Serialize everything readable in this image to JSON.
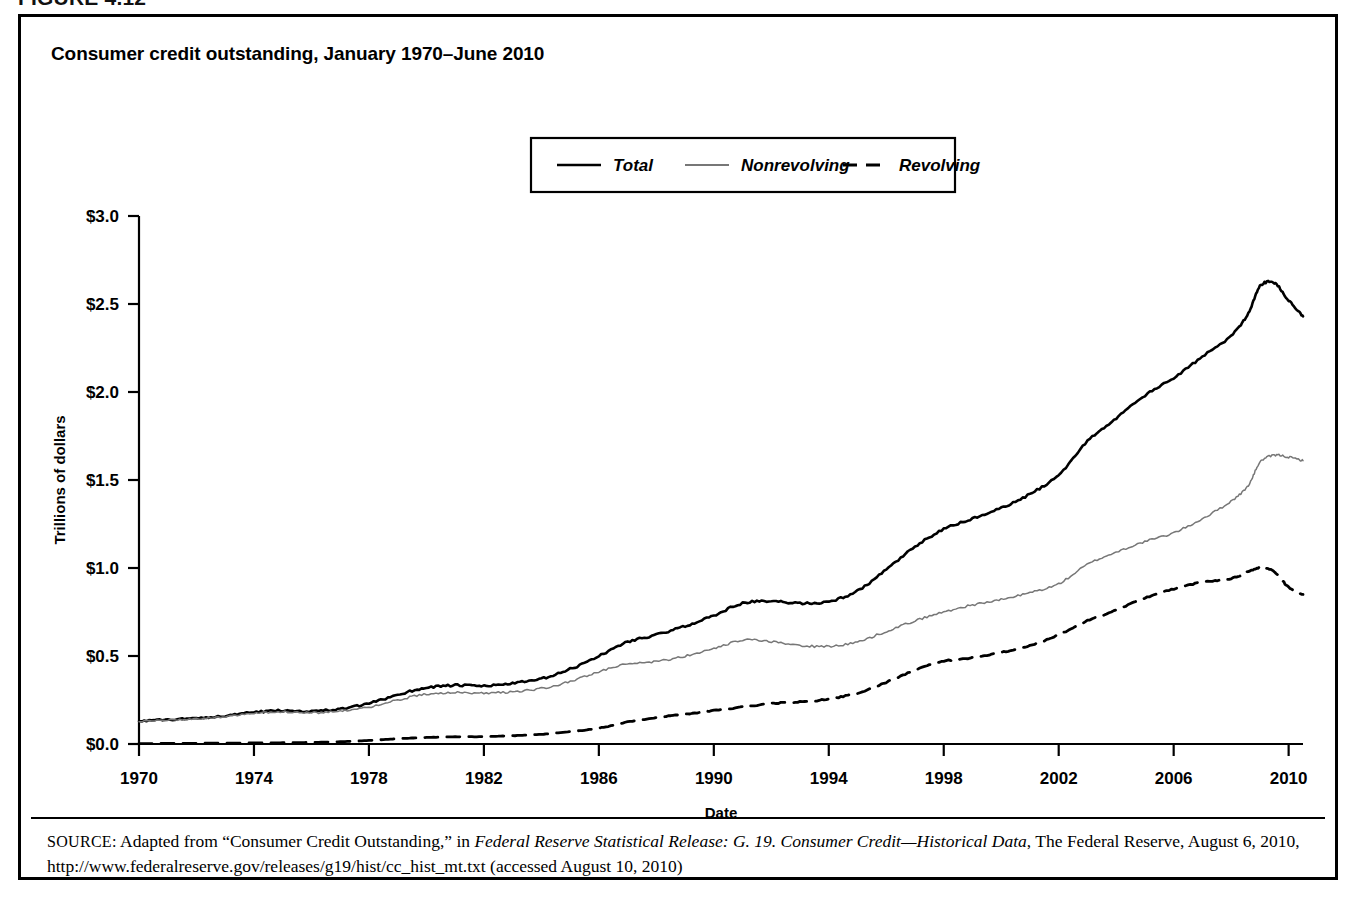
{
  "figure": {
    "label": "FIGURE 4.12",
    "title": "Consumer credit outstanding, January 1970–June 2010"
  },
  "source": {
    "prefix": "SOURCE:",
    "text_before_italic": " Adapted from “Consumer Credit Outstanding,” in ",
    "italic_title": "Federal Reserve Statistical Release: G. 19. Consumer Credit—Historical Data",
    "text_after_italic": ", The Federal Reserve, August 6, 2010, http://www.federalreserve.gov/releases/g19/hist/cc_hist_mt.txt (accessed August 10, 2010)"
  },
  "chart_data": {
    "type": "line",
    "title": "Consumer credit outstanding, January 1970–June 2010",
    "xlabel": "Date",
    "ylabel": "Trillions of dollars",
    "xlim": [
      1970,
      2010.5
    ],
    "ylim": [
      0.0,
      3.0
    ],
    "grid": false,
    "legend_position": "top-center",
    "x_ticks": [
      1970,
      1974,
      1978,
      1982,
      1986,
      1990,
      1994,
      1998,
      2002,
      2006,
      2010
    ],
    "x_tick_labels": [
      "1970",
      "1974",
      "1978",
      "1982",
      "1986",
      "1990",
      "1994",
      "1998",
      "2002",
      "2006",
      "2010"
    ],
    "y_ticks": [
      0.0,
      0.5,
      1.0,
      1.5,
      2.0,
      2.5,
      3.0
    ],
    "y_tick_labels": [
      "$0.0",
      "$0.5",
      "$1.0",
      "$1.5",
      "$2.0",
      "$2.5",
      "$3.0"
    ],
    "x": [
      1970,
      1971,
      1972,
      1973,
      1974,
      1975,
      1976,
      1977,
      1978,
      1979,
      1980,
      1981,
      1982,
      1983,
      1984,
      1985,
      1986,
      1987,
      1988,
      1989,
      1990,
      1991,
      1992,
      1993,
      1994,
      1995,
      1996,
      1997,
      1998,
      1999,
      2000,
      2001,
      2002,
      2003,
      2004,
      2005,
      2006,
      2007,
      2008,
      2008.6,
      2009,
      2009.5,
      2010,
      2010.5
    ],
    "series": [
      {
        "name": "Total",
        "color": "#000000",
        "style": "solid",
        "width": 2.6,
        "values": [
          0.131,
          0.138,
          0.147,
          0.16,
          0.18,
          0.19,
          0.187,
          0.199,
          0.23,
          0.28,
          0.32,
          0.333,
          0.33,
          0.345,
          0.37,
          0.425,
          0.5,
          0.58,
          0.62,
          0.67,
          0.73,
          0.8,
          0.81,
          0.8,
          0.81,
          0.87,
          0.99,
          1.12,
          1.22,
          1.28,
          1.34,
          1.42,
          1.53,
          1.72,
          1.85,
          1.98,
          2.08,
          2.2,
          2.32,
          2.45,
          2.6,
          2.62,
          2.52,
          2.43
        ]
      },
      {
        "name": "Nonrevolving",
        "color": "#777777",
        "style": "solid",
        "width": 1.5,
        "values": [
          0.129,
          0.135,
          0.143,
          0.155,
          0.174,
          0.183,
          0.178,
          0.186,
          0.21,
          0.25,
          0.283,
          0.292,
          0.288,
          0.298,
          0.315,
          0.355,
          0.41,
          0.455,
          0.47,
          0.5,
          0.54,
          0.59,
          0.58,
          0.56,
          0.555,
          0.58,
          0.64,
          0.7,
          0.75,
          0.79,
          0.82,
          0.86,
          0.91,
          1.02,
          1.09,
          1.15,
          1.2,
          1.28,
          1.38,
          1.47,
          1.6,
          1.64,
          1.63,
          1.61
        ]
      },
      {
        "name": "Revolving",
        "color": "#000000",
        "style": "dashed",
        "width": 2.8,
        "values": [
          0.002,
          0.003,
          0.004,
          0.005,
          0.006,
          0.007,
          0.009,
          0.013,
          0.02,
          0.03,
          0.037,
          0.041,
          0.042,
          0.047,
          0.055,
          0.07,
          0.09,
          0.125,
          0.15,
          0.17,
          0.19,
          0.21,
          0.23,
          0.24,
          0.255,
          0.29,
          0.35,
          0.42,
          0.47,
          0.49,
          0.52,
          0.56,
          0.62,
          0.7,
          0.76,
          0.83,
          0.88,
          0.92,
          0.94,
          0.98,
          1.0,
          0.98,
          0.89,
          0.85
        ]
      }
    ],
    "legend": [
      {
        "label": "Total",
        "style": "solid",
        "color": "#000000"
      },
      {
        "label": "Nonrevolving",
        "style": "solid",
        "color": "#777777"
      },
      {
        "label": "Revolving",
        "style": "dashed",
        "color": "#000000"
      }
    ]
  }
}
